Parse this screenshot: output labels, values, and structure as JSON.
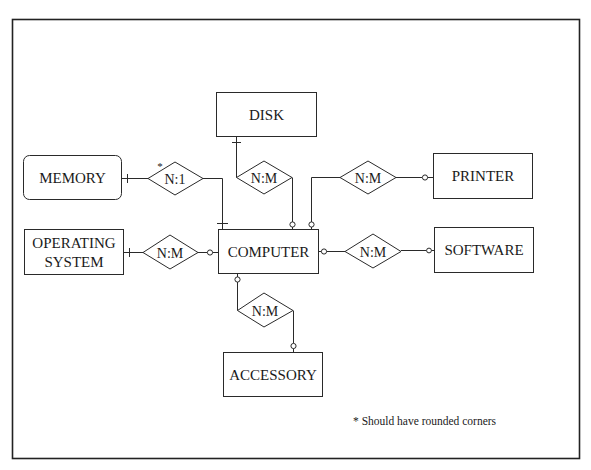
{
  "diagram": {
    "type": "entity-relationship",
    "entities": [
      {
        "id": "disk",
        "label": "DISK",
        "rounded": false
      },
      {
        "id": "memory",
        "label": "MEMORY",
        "rounded": true
      },
      {
        "id": "printer",
        "label": "PRINTER",
        "rounded": false
      },
      {
        "id": "os",
        "label_line1": "OPERATING",
        "label_line2": "SYSTEM",
        "rounded": false
      },
      {
        "id": "computer",
        "label": "COMPUTER",
        "rounded": false
      },
      {
        "id": "software",
        "label": "SOFTWARE",
        "rounded": false
      },
      {
        "id": "accessory",
        "label": "ACCESSORY",
        "rounded": false
      }
    ],
    "relationships": [
      {
        "id": "memory-computer",
        "label": "N:1",
        "from": "memory",
        "to": "computer",
        "marker": "*",
        "from_end": "one",
        "to_end": "one"
      },
      {
        "id": "disk-computer",
        "label": "N:M",
        "from": "disk",
        "to": "computer",
        "from_end": "one",
        "to_end": "zero-or-more"
      },
      {
        "id": "computer-printer",
        "label": "N:M",
        "from": "computer",
        "to": "printer",
        "from_end": "zero-or-more",
        "to_end": "zero-or-more"
      },
      {
        "id": "os-computer",
        "label": "N:M",
        "from": "os",
        "to": "computer",
        "from_end": "one",
        "to_end": "zero-or-more"
      },
      {
        "id": "computer-software",
        "label": "N:M",
        "from": "computer",
        "to": "software",
        "from_end": "zero-or-more",
        "to_end": "zero-or-more"
      },
      {
        "id": "computer-accessory",
        "label": "N:M",
        "from": "computer",
        "to": "accessory",
        "from_end": "zero-or-more",
        "to_end": "zero-or-more"
      }
    ],
    "footnote": "* Should have rounded corners",
    "asterisk": "*"
  }
}
